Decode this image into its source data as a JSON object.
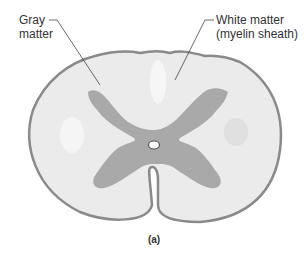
{
  "figure": {
    "caption": "(a)",
    "labels": {
      "gray_matter_line1": "Gray",
      "gray_matter_line2": "matter",
      "white_matter_line1": "White matter",
      "white_matter_line2": "(myelin sheath)"
    },
    "colors": {
      "outline": "#8a8a8a",
      "white_matter": "#ebebeb",
      "gray_matter": "#a9a9a9",
      "leader_line": "#444444",
      "text": "#333333"
    }
  }
}
